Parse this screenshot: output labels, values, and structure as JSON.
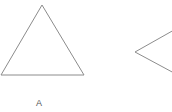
{
  "figures": [
    {
      "label": "A",
      "type": "triangle",
      "points": "42,5 1,75 84,75"
    },
    {
      "label": "",
      "type": "angle",
      "points": "174,30 135,52 174,73"
    }
  ],
  "colors": {
    "stroke": "#8c8c8c",
    "background": "#ffffff"
  }
}
